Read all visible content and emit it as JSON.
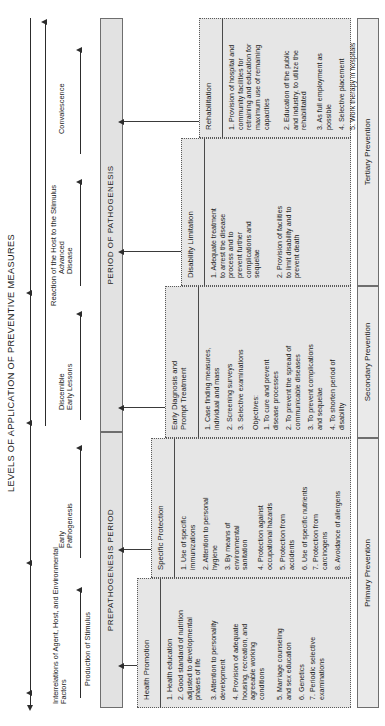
{
  "title": "LEVELS OF APPLICATION OF PREVENTIVE MEASURES",
  "axis": {
    "stage_labels": [
      "Interrelations of Agent, Host, and Environmental\nFactors",
      "Production of Stimulus",
      "Early\nPathogenesis",
      "Discernible\nEarly Lessons",
      "Advanced\nDisease",
      "Convalescence"
    ],
    "group_left": "",
    "group_right": "Reaction of the Host to the Stimulus"
  },
  "periods": [
    {
      "label": "PREPATHOGENESIS PERIOD"
    },
    {
      "label": "PERIOD OF PATHOGENESIS"
    }
  ],
  "measures": [
    {
      "head": "Health Promotion",
      "items": [
        "Health education",
        "Good standard of nutrition\nadjusted to developmental\nphases of life",
        "Attention to personality\ndevelopment",
        "Provision of adequate\nhousing, recreation, and\nagreeable working\nconditions",
        "Marriage counseling\nand sex education",
        "Genetics",
        "Periodic selective\nexaminations"
      ]
    },
    {
      "head": "Specific Protection",
      "items": [
        "Use of specific\nimmunizations",
        "Attention to personal\nhygiene",
        "By means of\nenvironmental\nsanitation",
        "Protection against\noccupational hazards",
        "Protection from\naccidents",
        "Use of specific nutrients",
        "Protection from\ncarcinogens",
        "Avoidance of allergens"
      ]
    },
    {
      "head": "Early Diagnosis and\nPrompt Treatment",
      "items": [
        "Case finding measures,\nindividual and mass",
        "Screening surveys",
        "Selective examinations"
      ],
      "subhead": "Objectives:",
      "subitems": [
        "To cure and prevent\ndisease processes",
        "To prevent the spread of\ncommunicable diseases",
        "To prevent complications\nand sequelae",
        "To shorten period of\ndisability"
      ]
    },
    {
      "head": "Disability Limitation",
      "items": [
        "Adequate treatment\nto arrest the disease\nprocess and to\nprevent further\ncomplications and\nsequelae",
        "Provision of facilities\nto limit disability and to\nprevent death"
      ]
    },
    {
      "head": "Rehabilitation",
      "items": [
        "Provision of hospital and\ncommunity facilities for\nretraining and education for\nmaximum use of remaining\ncapacities",
        "Education of the public\nand industry, to utilize the\nrehabilitated",
        "As full employment as\npossible",
        "Selective placement",
        "Work therapy in hospitals",
        "Use sheltered colony"
      ]
    }
  ],
  "prevention_levels": [
    "Primary Prevention",
    "Secondary Prevention",
    "Tertiary Prevention"
  ],
  "colors": {
    "box_fill": "#e6e6e6",
    "band_fill": "#e2e2e2",
    "stroke": "#3a3a3a"
  }
}
